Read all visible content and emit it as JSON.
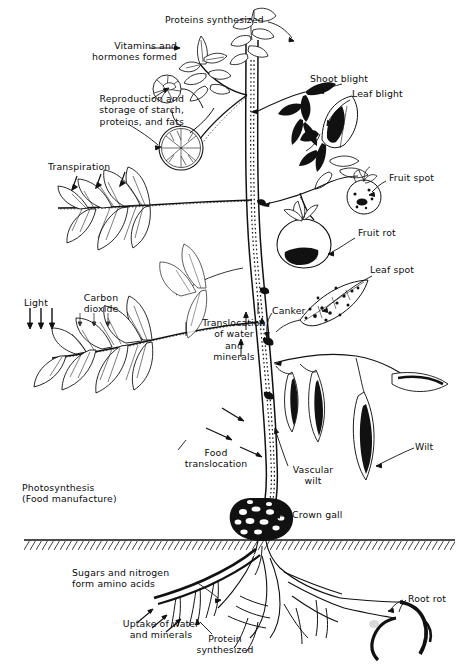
{
  "figure": {
    "style": "black-and-white line drawing",
    "ink_color": "#111111",
    "background_color": "#ffffff"
  },
  "labels": {
    "proteins_synthesized_top": "Proteins synthesized",
    "vitamins_and_hormones": "Vitamins and\nhormones formed",
    "reproduction_storage": "Reproduction and\nstorage of starch,\nproteins, and fats",
    "transpiration": "Transpiration",
    "light": "Light",
    "carbon_dioxide": "Carbon\ndioxide",
    "photosynthesis": "Photosynthesis\n(Food manufacture)",
    "translocation_water_minerals": "Translocation\nof water\nand\nminerals",
    "food_translocation": "Food\ntranslocation",
    "shoot_blight": "Shoot blight",
    "leaf_blight": "Leaf blight",
    "fruit_spot": "Fruit spot",
    "fruit_rot": "Fruit rot",
    "leaf_spot": "Leaf spot",
    "canker": "Canker",
    "wilt": "Wilt",
    "vascular_wilt": "Vascular\nwilt",
    "crown_gall": "Crown gall",
    "sugars_nitrogen": "Sugars and nitrogen\nform amino acids",
    "uptake_water_minerals": "Uptake of water\nand minerals",
    "protein_synthesized_root": "Protein\nsynthesized",
    "root_rot": "Root rot"
  },
  "groups": {
    "plant_functions": [
      "Proteins synthesized",
      "Vitamins and hormones formed",
      "Reproduction and storage of starch, proteins, and fats",
      "Transpiration",
      "Light",
      "Carbon dioxide",
      "Photosynthesis (Food manufacture)",
      "Translocation of water and minerals",
      "Food translocation",
      "Sugars and nitrogen form amino acids",
      "Uptake of water and minerals",
      "Protein synthesized"
    ],
    "disease_symptoms": [
      "Shoot blight",
      "Leaf blight",
      "Fruit spot",
      "Fruit rot",
      "Leaf spot",
      "Canker",
      "Wilt",
      "Vascular wilt",
      "Crown gall",
      "Root rot"
    ]
  },
  "arrow_counts": {
    "transpiration_arrows": 3,
    "light_arrows": 3,
    "carbon_dioxide_arrows": 3,
    "uptake_arrows": 3
  }
}
